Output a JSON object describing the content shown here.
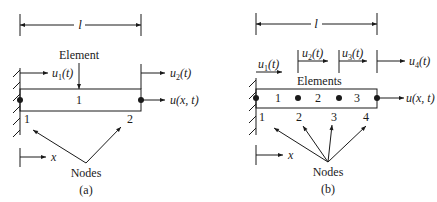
{
  "diagrams": [
    {
      "id": "a",
      "caption": "(a)",
      "length_label": "l",
      "element_label": "Element",
      "element_numbers": [
        "1"
      ],
      "node_numbers": [
        "1",
        "2"
      ],
      "nodes_label": "Nodes",
      "displacements": [
        "u1(t)",
        "u2(t)"
      ],
      "disp_base": "u",
      "disp_subs": [
        "1",
        "2"
      ],
      "disp_arg": "(t)",
      "field_label": "u(x, t)",
      "axis_label": "x"
    },
    {
      "id": "b",
      "caption": "(b)",
      "length_label": "l",
      "element_label": "Elements",
      "element_numbers": [
        "1",
        "2",
        "3"
      ],
      "node_numbers": [
        "1",
        "2",
        "3",
        "4"
      ],
      "nodes_label": "Nodes",
      "displacements": [
        "u1(t)",
        "u2(t)",
        "u3(t)",
        "u4(t)"
      ],
      "disp_base": "u",
      "disp_subs": [
        "1",
        "2",
        "3",
        "4"
      ],
      "disp_arg": "(t)",
      "field_label": "u(x, t)",
      "axis_label": "x"
    }
  ],
  "colors": {
    "ink": "#1a1a1a",
    "background": "#ffffff"
  }
}
